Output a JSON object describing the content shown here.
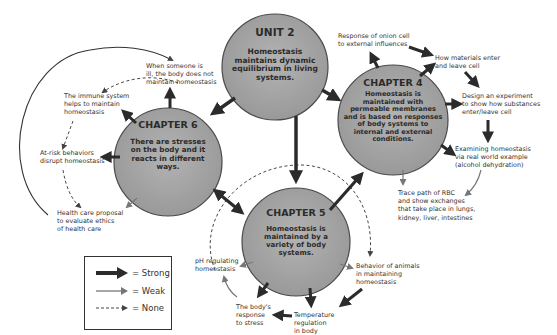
{
  "diagram": {
    "type": "concept-map",
    "circles": {
      "unit2": {
        "title": "UNIT 2",
        "body": "Homeostasis maintains dynamic equilibrium in living systems."
      },
      "chapter4": {
        "title": "CHAPTER 4",
        "body": "Homeostasis is maintained with permeable membranes and is based on responses of body systems to internal and external conditions."
      },
      "chapter5": {
        "title": "CHAPTER 5",
        "body": "Homeostasis is maintained by a variety of body systems."
      },
      "chapter6": {
        "title": "CHAPTER 6",
        "body": "There are stresses on the body and it reacts in different ways."
      }
    },
    "labels": {
      "onion": "Response of onion cell\nto external influences",
      "materials": "How materials enter\nand leave cell",
      "design": "Design an experiment\nto show how substances\nenter/leave cell",
      "examining": "Examining homeostasis\nvia real world example\n(alcohol dehydration)",
      "rbc": "Trace path of RBC\nand show exchanges\nthat take place in lungs,\nkidney, liver, intestines",
      "ill": "When someone is\nill, the body does not\nmaintain homeostasis",
      "immune": "The immune system\nhelps to maintain\nhomeostasis",
      "atrisk": "At-risk behaviors\ndisrupt homeostasis",
      "healthcare": "Health care proposal\nto evaluate ethics\nof health care",
      "ph": "pH regulating\nhomeostasis",
      "behavior": "Behavior of animals\nin maintaining\nhomeostasis",
      "stress": "The body's\nresponse\nto stress",
      "temperature": "Temperature\nregulation\nin body"
    },
    "legend": {
      "strong": "= Strong",
      "weak": "= Weak",
      "none": "= None"
    },
    "colors": {
      "circle_fill": "#a3a3a3",
      "circle_stroke": "#4a4a4a",
      "strong_arrow": "#2b2b2b",
      "weak_arrow": "#7a7a7a"
    }
  }
}
